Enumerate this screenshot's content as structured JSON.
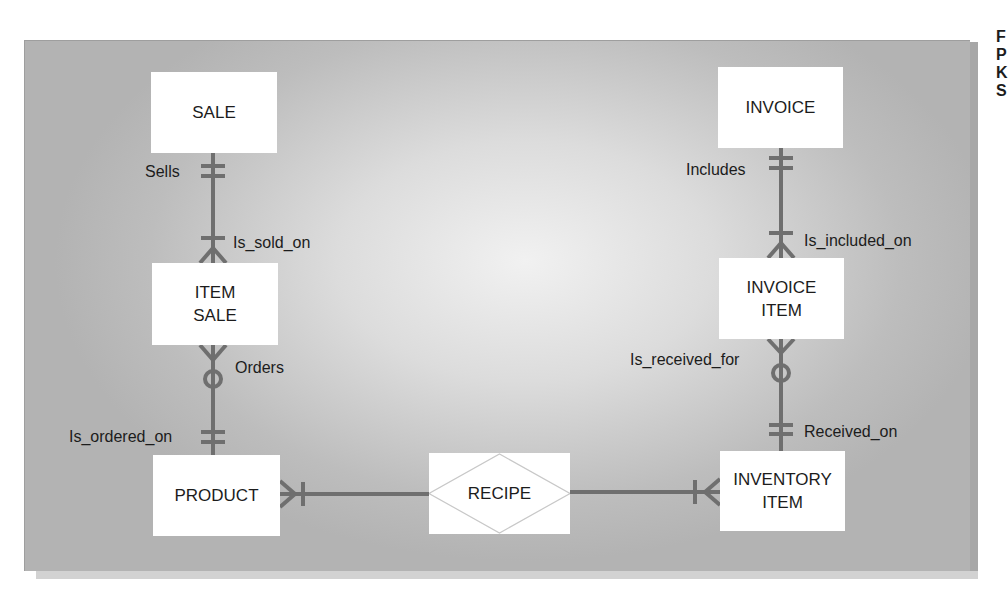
{
  "diagram": {
    "type": "entity-relationship",
    "entities": {
      "sale": "SALE",
      "item_sale": "ITEM\nSALE",
      "product": "PRODUCT",
      "recipe": "RECIPE",
      "inventory_item": "INVENTORY\nITEM",
      "invoice_item": "INVOICE\nITEM",
      "invoice": "INVOICE"
    },
    "relationship_labels": {
      "sells": "Sells",
      "is_sold_on": "Is_sold_on",
      "orders": "Orders",
      "is_ordered_on": "Is_ordered_on",
      "includes": "Includes",
      "is_included_on": "Is_included_on",
      "is_received_for": "Is_received_for",
      "received_on": "Received_on"
    },
    "relationships": [
      {
        "from": "SALE",
        "to": "ITEM SALE",
        "from_cardinality": "one-and-only-one",
        "to_cardinality": "one-or-many"
      },
      {
        "from": "ITEM SALE",
        "to": "PRODUCT",
        "from_cardinality": "zero-or-many",
        "to_cardinality": "one-and-only-one"
      },
      {
        "from": "PRODUCT",
        "to": "RECIPE",
        "from_cardinality": "one-or-many"
      },
      {
        "from": "RECIPE",
        "to": "INVENTORY ITEM",
        "to_cardinality": "one-or-many"
      },
      {
        "from": "INVOICE",
        "to": "INVOICE ITEM",
        "from_cardinality": "one-and-only-one",
        "to_cardinality": "one-or-many"
      },
      {
        "from": "INVOICE ITEM",
        "to": "INVENTORY ITEM",
        "from_cardinality": "zero-or-many",
        "to_cardinality": "one-and-only-one"
      }
    ],
    "colors": {
      "panel_center": "#f1f1f1",
      "panel_edge": "#b3b3b3",
      "connector": "#6f6f6f",
      "entity_fill": "#ffffff",
      "diamond_stroke": "#c8c8c8"
    }
  },
  "side_text": {
    "lines": [
      "F",
      "P",
      "K",
      "S"
    ]
  }
}
